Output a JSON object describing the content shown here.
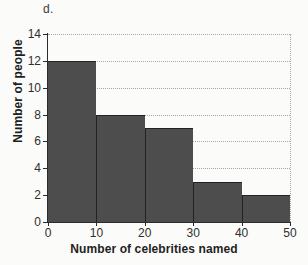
{
  "figure": {
    "panel_label": "d."
  },
  "chart_data": {
    "type": "bar",
    "title": "",
    "subtitle": "",
    "xlabel": "Number of celebrities named",
    "ylabel": "Number of people",
    "categories": [
      "0-10",
      "10-20",
      "20-30",
      "30-40",
      "40-50"
    ],
    "bin_edges": [
      0,
      10,
      20,
      30,
      40,
      50
    ],
    "values": [
      12,
      8,
      7,
      3,
      2
    ],
    "xlim": [
      0,
      50
    ],
    "ylim": [
      0,
      14
    ],
    "xticks": [
      "0",
      "10",
      "20",
      "30",
      "40",
      "50"
    ],
    "xtick_values": [
      0,
      10,
      20,
      30,
      40,
      50
    ],
    "yticks": [
      "0",
      "2",
      "4",
      "6",
      "8",
      "10",
      "12",
      "14"
    ],
    "ytick_values": [
      0,
      2,
      4,
      6,
      8,
      10,
      12,
      14
    ],
    "grid": "horizontal-dotted",
    "legend": "none",
    "bar_color": "#4d4d4d",
    "bar_edge_color": "#232323",
    "grid_color": "#a8a8a8",
    "axis_color": "#2b2b2b",
    "background_color": "#fbfbf9"
  }
}
